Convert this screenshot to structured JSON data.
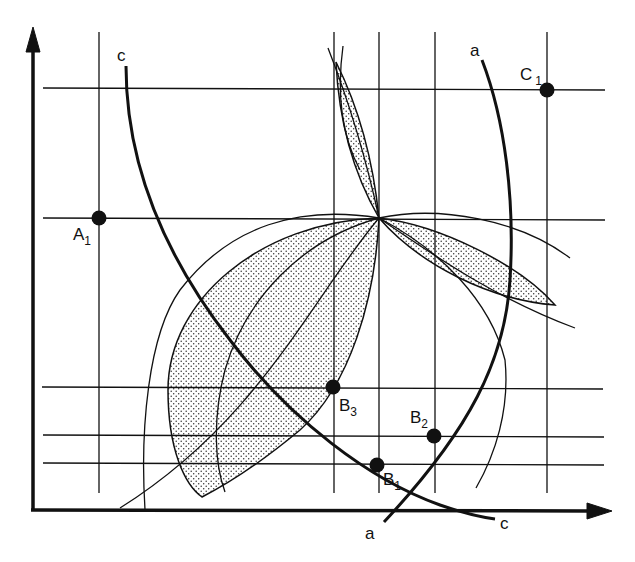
{
  "diagram": {
    "type": "geometric construction",
    "colors": {
      "ink": "#111111",
      "background": "#ffffff",
      "stipple": "#333333"
    },
    "axes": {
      "x_axis": {
        "has_arrow": true,
        "direction": "right"
      },
      "y_axis": {
        "has_arrow": true,
        "direction": "up"
      }
    },
    "curves": [
      {
        "name": "a",
        "label_top": "a",
        "label_bottom": "a"
      },
      {
        "name": "c",
        "label_top": "c",
        "label_bottom": "c"
      }
    ],
    "points": [
      {
        "id": "A1",
        "letter": "A",
        "sub": "1"
      },
      {
        "id": "C1",
        "letter": "C",
        "sub": "1"
      },
      {
        "id": "B1",
        "letter": "B",
        "sub": "1"
      },
      {
        "id": "B2",
        "letter": "B",
        "sub": "2"
      },
      {
        "id": "B3",
        "letter": "B",
        "sub": "3"
      }
    ],
    "gridlines": {
      "vertical_count": 5,
      "horizontal_count": 5
    },
    "shaded_regions": [
      {
        "name": "upper-lens",
        "pattern": "stipple"
      },
      {
        "name": "large-left-lens",
        "pattern": "stipple"
      },
      {
        "name": "right-lens",
        "pattern": "stipple"
      }
    ]
  }
}
